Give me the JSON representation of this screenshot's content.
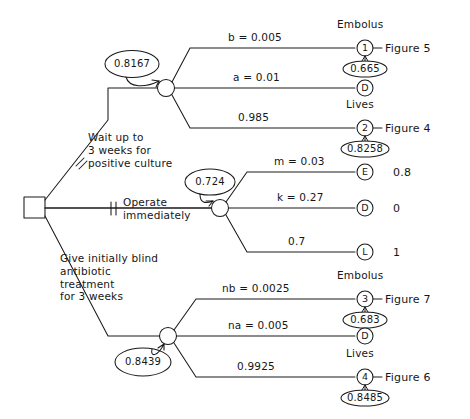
{
  "diagram": {
    "type": "decision-tree",
    "ink_color": "#1a1a1a",
    "background": "#ffffff"
  },
  "root": {
    "node_type": "decision-square",
    "name": "root-decision-node"
  },
  "strategies": [
    {
      "id": "wait",
      "label": "Wait up to\n3 weeks for\npositive culture",
      "marked_rejected": true,
      "reject_mark": "double-slash",
      "expected_value": "0.8167",
      "branches": [
        {
          "prob_label": "b = 0.005",
          "outcome_name": "Embolus",
          "node_glyph": "1",
          "figure": "Figure 5",
          "sub_value": "0.665"
        },
        {
          "prob_label": "a = 0.01",
          "outcome_name": "",
          "node_glyph": "D",
          "figure": "",
          "sub_value": ""
        },
        {
          "prob_label": "0.985",
          "outcome_name": "Lives",
          "node_glyph": "2",
          "figure": "Figure 4",
          "sub_value": "0.8258"
        }
      ]
    },
    {
      "id": "operate",
      "label": "Operate\nimmediately",
      "marked_rejected": true,
      "reject_mark": "double-slash",
      "expected_value": "0.724",
      "branches": [
        {
          "prob_label": "m = 0.03",
          "outcome_name": "",
          "node_glyph": "E",
          "payoff": "0.8"
        },
        {
          "prob_label": "k = 0.27",
          "outcome_name": "",
          "node_glyph": "D",
          "payoff": "0"
        },
        {
          "prob_label": "0.7",
          "outcome_name": "",
          "node_glyph": "L",
          "payoff": "1"
        }
      ]
    },
    {
      "id": "blind-antibiotic",
      "label": "Give initially blind\nantibiotic\ntreatment\nfor 3 weeks",
      "marked_rejected": false,
      "expected_value": "0.8439",
      "branches": [
        {
          "prob_label": "nb = 0.0025",
          "outcome_name": "Embolus",
          "node_glyph": "3",
          "figure": "Figure 7",
          "sub_value": "0.683"
        },
        {
          "prob_label": "na = 0.005",
          "outcome_name": "",
          "node_glyph": "D",
          "figure": "",
          "sub_value": ""
        },
        {
          "prob_label": "0.9925",
          "outcome_name": "Lives",
          "node_glyph": "4",
          "figure": "Figure 6",
          "sub_value": "0.8485"
        }
      ]
    }
  ]
}
